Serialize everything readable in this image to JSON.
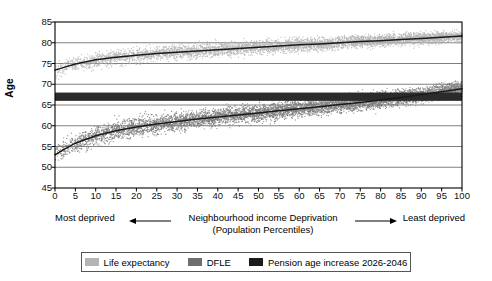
{
  "chart_data": {
    "type": "scatter",
    "title": "",
    "xlabel": "Neighbourhood income Deprivation (Population Percentiles)",
    "ylabel": "Age",
    "xlim": [
      0,
      100
    ],
    "ylim": [
      45,
      85
    ],
    "grid": true,
    "x_ticks": [
      0,
      5,
      10,
      15,
      20,
      25,
      30,
      35,
      40,
      45,
      50,
      55,
      60,
      65,
      70,
      75,
      80,
      85,
      90,
      95,
      100
    ],
    "y_ticks": [
      45,
      50,
      55,
      60,
      65,
      70,
      75,
      80,
      85
    ],
    "series": [
      {
        "name": "Life expectancy",
        "type": "scatter-with-trend",
        "color": "#b4b4b4",
        "trend_color": "#1a1a1a",
        "scatter_spread": 2.0,
        "trend_x": [
          0,
          2,
          5,
          10,
          15,
          20,
          25,
          30,
          35,
          40,
          45,
          50,
          55,
          60,
          65,
          70,
          75,
          80,
          85,
          90,
          95,
          100
        ],
        "trend_y": [
          73.4,
          74.0,
          74.9,
          75.9,
          76.5,
          77.0,
          77.4,
          77.7,
          78.0,
          78.3,
          78.6,
          78.9,
          79.2,
          79.5,
          79.7,
          80.0,
          80.3,
          80.5,
          80.8,
          81.0,
          81.3,
          81.6
        ]
      },
      {
        "name": "DFLE",
        "type": "scatter-with-trend",
        "color": "#7a7a7a",
        "trend_color": "#1a1a1a",
        "scatter_spread": 2.6,
        "trend_x": [
          0,
          2,
          5,
          10,
          15,
          20,
          25,
          30,
          35,
          40,
          45,
          50,
          55,
          60,
          65,
          70,
          75,
          80,
          85,
          90,
          95,
          100
        ],
        "trend_y": [
          53.0,
          54.2,
          55.8,
          57.6,
          58.8,
          59.7,
          60.4,
          61.0,
          61.6,
          62.1,
          62.6,
          63.1,
          63.6,
          64.1,
          64.6,
          65.1,
          65.6,
          66.2,
          66.8,
          67.5,
          68.2,
          68.9
        ]
      },
      {
        "name": "Pension age increase 2026-2046",
        "type": "band",
        "color": "#2b2b2b",
        "y_low": 66.0,
        "y_high": 68.0
      }
    ],
    "annotations": {
      "left_label": "Most deprived",
      "right_label": "Least deprived",
      "axis_line1": "Neighbourhood income Deprivation",
      "axis_line2": "(Population Percentiles)"
    },
    "legend": {
      "position": "bottom",
      "entries": [
        {
          "label": "Life expectancy",
          "color": "#b4b4b4"
        },
        {
          "label": "DFLE",
          "color": "#6e6e6e"
        },
        {
          "label": "Pension age increase 2026-2046",
          "color": "#1c1c1c"
        }
      ]
    }
  },
  "axis": {
    "y_title": "Age",
    "y_ticks": [
      "85",
      "80",
      "75",
      "70",
      "65",
      "60",
      "55",
      "50",
      "45"
    ],
    "x_ticks": [
      "0",
      "5",
      "10",
      "15",
      "20",
      "25",
      "30",
      "35",
      "40",
      "45",
      "50",
      "55",
      "60",
      "65",
      "70",
      "75",
      "80",
      "85",
      "90",
      "95",
      "100"
    ]
  },
  "caption": {
    "left": "Most deprived",
    "center_line1": "Neighbourhood income Deprivation",
    "center_line2": "(Population Percentiles)",
    "right": "Least deprived"
  },
  "legend": {
    "items": [
      {
        "label": "Life expectancy",
        "color": "#b4b4b4"
      },
      {
        "label": "DFLE",
        "color": "#6e6e6e"
      },
      {
        "label": "Pension age increase 2026-2046",
        "color": "#1c1c1c"
      }
    ]
  }
}
